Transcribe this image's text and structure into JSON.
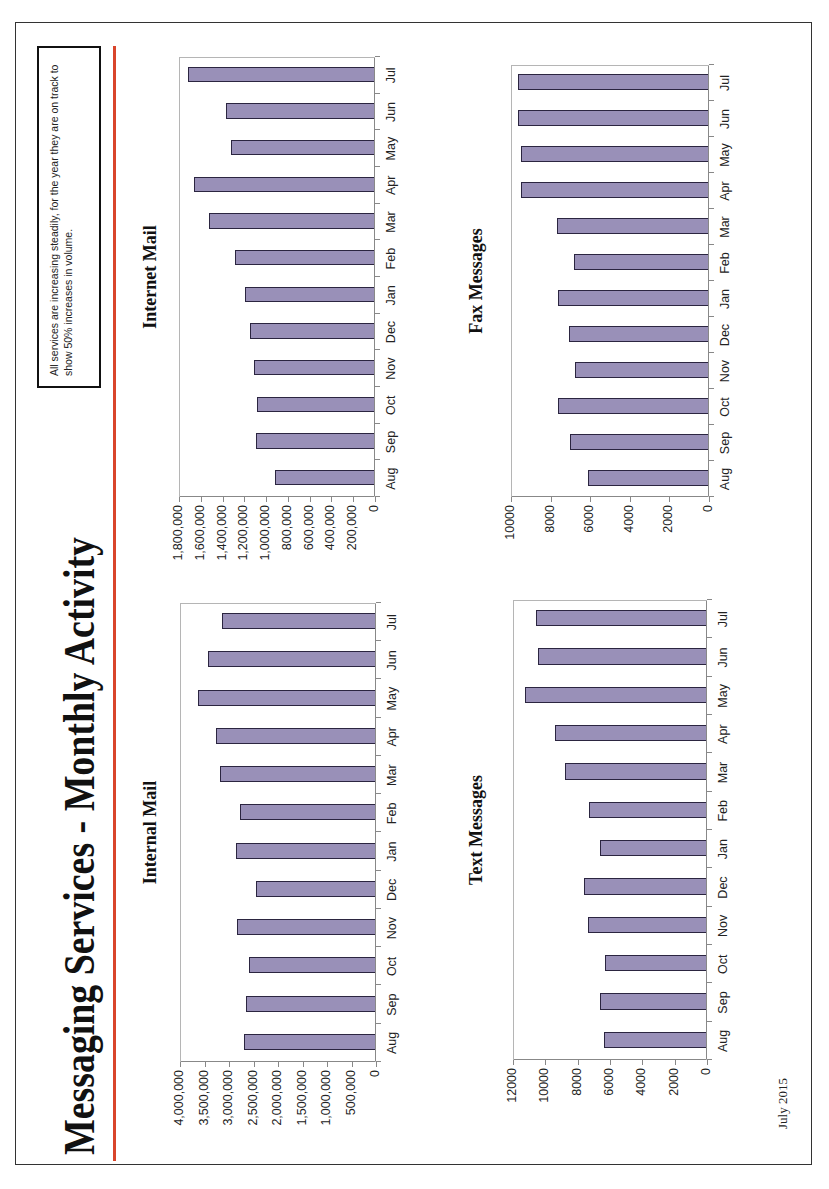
{
  "page": {
    "title": "Messaging Services - Monthly Activity",
    "callout": "All services are increasing steadily, for the year they are on track to show 50% increases in volume.",
    "footer": "July 2015",
    "accent_rule_color": "#d9452b",
    "bar_color": "#9990b8",
    "bar_border_color": "#2b2540"
  },
  "chart_data": [
    {
      "id": "internal",
      "type": "bar",
      "title": "Internal Mail",
      "categories": [
        "Aug",
        "Sep",
        "Oct",
        "Nov",
        "Dec",
        "Jan",
        "Feb",
        "Mar",
        "Apr",
        "May",
        "Jun",
        "Jul"
      ],
      "values": [
        2670000,
        2630000,
        2570000,
        2820000,
        2430000,
        2840000,
        2760000,
        3160000,
        3240000,
        3610000,
        3410000,
        3120000
      ],
      "ylim": [
        0,
        4000000
      ],
      "yticks": [
        "0",
        "500,000",
        "1,000,000",
        "1,500,000",
        "2,000,000",
        "2,500,000",
        "3,000,000",
        "3,500,000",
        "4,000,000"
      ],
      "xlabel": "",
      "ylabel": "",
      "legend": false,
      "grid": false,
      "frame": {
        "left": 127,
        "top": 180,
        "width": 459,
        "height": 196
      },
      "title_pos": {
        "left": 127,
        "top": 140,
        "width": 459
      }
    },
    {
      "id": "internet",
      "type": "bar",
      "title": "Internet Mail",
      "categories": [
        "Aug",
        "Sep",
        "Oct",
        "Nov",
        "Dec",
        "Jan",
        "Feb",
        "Mar",
        "Apr",
        "May",
        "Jun",
        "Jul"
      ],
      "values": [
        909000,
        1086000,
        1076000,
        1104000,
        1141000,
        1188000,
        1280000,
        1512000,
        1652000,
        1318000,
        1355000,
        1707000
      ],
      "ylim": [
        0,
        1800000
      ],
      "yticks": [
        "0",
        "200,000",
        "400,000",
        "600,000",
        "800,000",
        "1,000,000",
        "1,200,000",
        "1,400,000",
        "1,600,000",
        "1,800,000"
      ],
      "xlabel": "",
      "ylabel": "",
      "legend": false,
      "grid": false,
      "frame": {
        "left": 692,
        "top": 179,
        "width": 440,
        "height": 196
      },
      "title_pos": {
        "left": 692,
        "top": 140,
        "width": 440
      }
    },
    {
      "id": "text",
      "type": "bar",
      "title": "Text Messages",
      "categories": [
        "Aug",
        "Sep",
        "Oct",
        "Nov",
        "Dec",
        "Jan",
        "Feb",
        "Mar",
        "Apr",
        "May",
        "Jun",
        "Jul"
      ],
      "values": [
        6300,
        6550,
        6250,
        7300,
        7550,
        6550,
        7250,
        8700,
        9350,
        11200,
        10400,
        10500
      ],
      "ylim": [
        0,
        12000
      ],
      "yticks": [
        "0",
        "2000",
        "4000",
        "6000",
        "8000",
        "10000",
        "12000"
      ],
      "xlabel": "",
      "ylabel": "",
      "legend": false,
      "grid": false,
      "frame": {
        "left": 129,
        "top": 513,
        "width": 460,
        "height": 194
      },
      "title_pos": {
        "left": 129,
        "top": 466,
        "width": 460
      }
    },
    {
      "id": "fax",
      "type": "bar",
      "title": "Fax Messages",
      "categories": [
        "Aug",
        "Sep",
        "Oct",
        "Nov",
        "Dec",
        "Jan",
        "Feb",
        "Mar",
        "Apr",
        "May",
        "Jun",
        "Jul"
      ],
      "values": [
        6050,
        6950,
        7600,
        6700,
        7000,
        7600,
        6750,
        7650,
        9450,
        9450,
        9600,
        9600
      ],
      "ylim": [
        0,
        10000
      ],
      "yticks": [
        "0",
        "2000",
        "4000",
        "6000",
        "8000",
        "10000"
      ],
      "xlabel": "",
      "ylabel": "",
      "legend": false,
      "grid": false,
      "frame": {
        "left": 692,
        "top": 511,
        "width": 432,
        "height": 198
      },
      "title_pos": {
        "left": 692,
        "top": 466,
        "width": 432
      }
    }
  ]
}
